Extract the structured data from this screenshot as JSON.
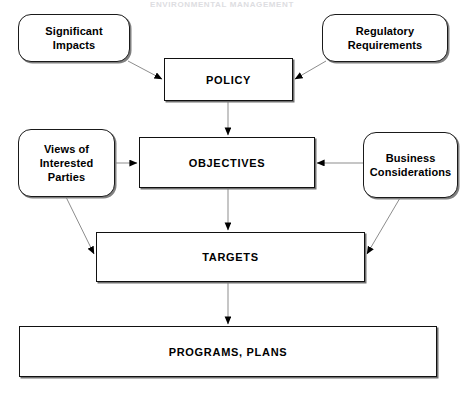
{
  "page": {
    "header_remnant": "ENVIRONMENTAL MANAGEMENT"
  },
  "diagram": {
    "type": "flowchart",
    "nodes": [
      {
        "id": "significant-impacts",
        "label": "Significant\nImpacts",
        "shape": "rounded-rectangle",
        "x": 18,
        "y": 14,
        "w": 112,
        "h": 48
      },
      {
        "id": "regulatory-requirements",
        "label": "Regulatory\nRequirements",
        "shape": "rounded-rectangle",
        "x": 322,
        "y": 14,
        "w": 126,
        "h": 48
      },
      {
        "id": "policy",
        "label": "POLICY",
        "shape": "rectangle",
        "x": 164,
        "y": 58,
        "w": 129,
        "h": 43
      },
      {
        "id": "views-of-interested-parties",
        "label": "Views of\nInterested\nParties",
        "shape": "rounded-rectangle",
        "x": 18,
        "y": 129,
        "w": 97,
        "h": 68
      },
      {
        "id": "objectives",
        "label": "OBJECTIVES",
        "shape": "rectangle",
        "x": 139,
        "y": 137,
        "w": 176,
        "h": 51
      },
      {
        "id": "business-considerations",
        "label": "Business\nConsiderations",
        "shape": "rounded-rectangle",
        "x": 363,
        "y": 132,
        "w": 95,
        "h": 66
      },
      {
        "id": "targets",
        "label": "TARGETS",
        "shape": "rectangle",
        "x": 96,
        "y": 232,
        "w": 269,
        "h": 50
      },
      {
        "id": "programs-plans",
        "label": "PROGRAMS, PLANS",
        "shape": "rectangle",
        "x": 19,
        "y": 326,
        "w": 418,
        "h": 51
      }
    ],
    "connectors": [
      {
        "id": "significant-impacts-to-policy",
        "from": "significant-impacts",
        "to": "policy",
        "style": "diagonal-arrow"
      },
      {
        "id": "regulatory-requirements-to-policy",
        "from": "regulatory-requirements",
        "to": "policy",
        "style": "diagonal-arrow"
      },
      {
        "id": "policy-to-objectives",
        "from": "policy",
        "to": "objectives",
        "style": "vertical-arrow"
      },
      {
        "id": "views-to-objectives",
        "from": "views-of-interested-parties",
        "to": "objectives",
        "style": "horizontal-arrow"
      },
      {
        "id": "business-to-objectives",
        "from": "business-considerations",
        "to": "objectives",
        "style": "horizontal-arrow"
      },
      {
        "id": "objectives-to-targets",
        "from": "objectives",
        "to": "targets",
        "style": "vertical-arrow"
      },
      {
        "id": "views-to-targets",
        "from": "views-of-interested-parties",
        "to": "targets",
        "style": "diagonal-arrow"
      },
      {
        "id": "business-to-targets",
        "from": "business-considerations",
        "to": "targets",
        "style": "diagonal-arrow"
      },
      {
        "id": "targets-to-programs",
        "from": "targets",
        "to": "programs-plans",
        "style": "vertical-arrow"
      }
    ],
    "colors": {
      "node_border": "#111111",
      "node_fill": "#ffffff",
      "connector": "#8d8d8d",
      "arrowhead": "#000000",
      "shadow": "#7a7a7a",
      "text": "#000000"
    }
  }
}
